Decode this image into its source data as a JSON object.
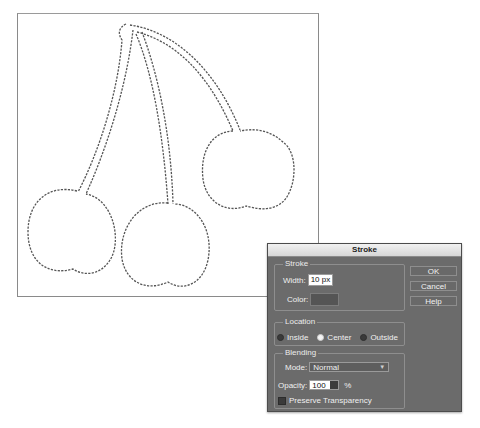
{
  "canvas": {
    "image_description": "cherries-outline-selection",
    "stroke_color": "#555555"
  },
  "dialog": {
    "title": "Stroke",
    "stroke_group": {
      "title": "Stroke",
      "width_label": "Width:",
      "width_value": "10 px",
      "color_label": "Color:",
      "color_value": "#555555"
    },
    "location_group": {
      "title": "Location",
      "options": [
        {
          "label": "Inside",
          "checked": false
        },
        {
          "label": "Center",
          "checked": true
        },
        {
          "label": "Outside",
          "checked": false
        }
      ]
    },
    "blending_group": {
      "title": "Blending",
      "mode_label": "Mode:",
      "mode_value": "Normal",
      "opacity_label": "Opacity:",
      "opacity_value": "100",
      "opacity_unit": "%",
      "preserve_transparency_label": "Preserve Transparency",
      "preserve_transparency_checked": false
    },
    "buttons": {
      "ok": "OK",
      "cancel": "Cancel",
      "help": "Help"
    }
  }
}
